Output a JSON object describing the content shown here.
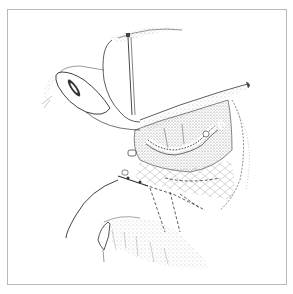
{
  "illustration": {
    "type": "anatomical line drawing",
    "stroke_color": "#2a2a2a",
    "stipple_color": "#7a7a7a",
    "frame_color": "#b8b8b8",
    "background": "#ffffff"
  }
}
